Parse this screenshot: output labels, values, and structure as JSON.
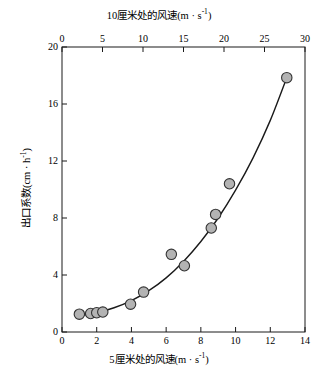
{
  "chart_data": {
    "type": "scatter",
    "title": "",
    "xlabel": "5厘米处的风速 (m · s-1)",
    "xlabel_top": "10厘米处的风速 (m · s-1)",
    "ylabel": "出口系数 (cm · h-1)",
    "xlim": [
      0,
      14
    ],
    "xlim_top": [
      0,
      30
    ],
    "ylim": [
      0,
      20
    ],
    "xticks": [
      0,
      2,
      4,
      6,
      8,
      10,
      12,
      14
    ],
    "xticks_top": [
      0,
      5,
      10,
      15,
      20,
      25,
      30
    ],
    "yticks": [
      0,
      4,
      8,
      12,
      16,
      20
    ],
    "grid": false,
    "legend": "none",
    "marker": {
      "shape": "circle",
      "fill": "#b3b3b3",
      "edge": "#333333",
      "size": 11
    },
    "points": [
      {
        "x": 1.0,
        "y": 1.25
      },
      {
        "x": 1.65,
        "y": 1.3
      },
      {
        "x": 2.0,
        "y": 1.35
      },
      {
        "x": 2.35,
        "y": 1.4
      },
      {
        "x": 3.95,
        "y": 1.95
      },
      {
        "x": 4.7,
        "y": 2.8
      },
      {
        "x": 6.3,
        "y": 5.45
      },
      {
        "x": 7.05,
        "y": 4.65
      },
      {
        "x": 8.6,
        "y": 7.3
      },
      {
        "x": 8.85,
        "y": 8.25
      },
      {
        "x": 9.65,
        "y": 10.4
      },
      {
        "x": 12.95,
        "y": 17.85
      }
    ],
    "fit_curve": {
      "label": "fitted-trend-curve",
      "color": "#1a1a1a",
      "x": [
        1.0,
        2.0,
        3.0,
        4.0,
        5.0,
        6.0,
        7.0,
        8.0,
        9.0,
        10.0,
        11.0,
        12.0,
        12.95
      ],
      "y": [
        1.15,
        1.35,
        1.7,
        2.2,
        2.9,
        3.8,
        4.95,
        6.35,
        8.0,
        9.95,
        12.2,
        14.85,
        17.85
      ]
    }
  },
  "axes": {
    "top": {
      "title_main": "10厘米处的风速",
      "title_unit_open": "(m · s",
      "title_unit_exp": "-1",
      "title_unit_close": ")",
      "ticks": [
        "0",
        "5",
        "10",
        "15",
        "20",
        "25",
        "30"
      ]
    },
    "bottom": {
      "title_main": "5厘米处的风速",
      "title_unit_open": "(m · s",
      "title_unit_exp": "-1",
      "title_unit_close": ")",
      "ticks": [
        "0",
        "2",
        "4",
        "6",
        "8",
        "10",
        "12",
        "14"
      ]
    },
    "left": {
      "title_main": "出口系数",
      "title_unit_open": "(cm · h",
      "title_unit_exp": "-1",
      "title_unit_close": ")",
      "ticks": [
        "0",
        "4",
        "8",
        "12",
        "16",
        "20"
      ]
    }
  },
  "colors": {
    "frame": "#1a1a1a",
    "marker_fill": "#b3b3b3",
    "marker_edge": "#333333",
    "curve": "#1a1a1a",
    "background": "#ffffff"
  }
}
